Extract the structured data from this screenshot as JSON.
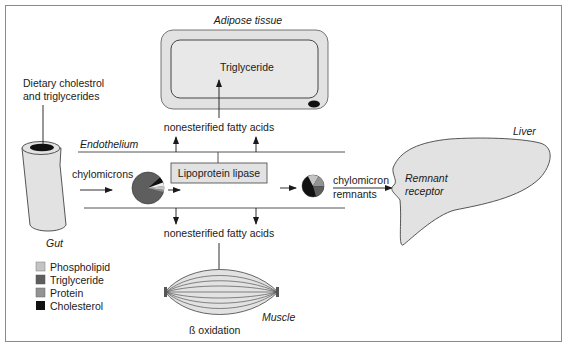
{
  "diagram": {
    "colors": {
      "frame": "#8a8a8a",
      "line": "#3a3a3a",
      "tissue_fill": "#e2e2e2",
      "phospholipid": "#c4c4c4",
      "triglyceride": "#5e5e5e",
      "protein": "#939393",
      "cholesterol": "#111111"
    },
    "labels": {
      "adipose_tissue": "Adipose tissue",
      "adipose_triglyceride": "Triglyceride",
      "nefa_top": "nonesterified fatty acids",
      "nefa_bottom": "nonesterified fatty acids",
      "endothelium": "Endothelium",
      "dietary_line1": "Dietary cholestrol",
      "dietary_line2": "and triglycerides",
      "chylomicrons": "chylomicrons",
      "lipoprotein_lipase": "Lipoprotein lipase",
      "remnants_line1": "chylomicron",
      "remnants_line2": "remnants",
      "liver": "Liver",
      "receptor_line1": "Remnant",
      "receptor_line2": "receptor",
      "gut": "Gut",
      "muscle": "Muscle",
      "beta_oxidation": "ß oxidation"
    },
    "legend": [
      {
        "label": "Phospholipid",
        "color": "#c4c4c4"
      },
      {
        "label": "Triglyceride",
        "color": "#5e5e5e"
      },
      {
        "label": "Protein",
        "color": "#939393"
      },
      {
        "label": "Cholesterol",
        "color": "#111111"
      }
    ],
    "pies": {
      "chylomicron": [
        {
          "component": "Triglyceride",
          "share": 0.9
        },
        {
          "component": "Cholesterol",
          "share": 0.03
        },
        {
          "component": "Phospholipid",
          "share": 0.05
        },
        {
          "component": "Protein",
          "share": 0.02
        }
      ],
      "remnant": [
        {
          "component": "Cholesterol",
          "share": 0.38
        },
        {
          "component": "Phospholipid",
          "share": 0.2
        },
        {
          "component": "Protein",
          "share": 0.17
        },
        {
          "component": "Triglyceride",
          "share": 0.25
        }
      ]
    }
  }
}
